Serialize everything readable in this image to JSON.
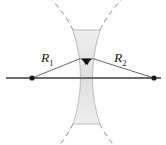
{
  "figure": {
    "name": "biconcave-lens-radii-of-curvature",
    "background_color": "#ffffff"
  },
  "labels": [
    {
      "id": "r1",
      "name": "radius-label-r1",
      "symbol": "R",
      "subscript": "1",
      "x": 41,
      "y": 62,
      "color": "#1a1a1a"
    },
    {
      "id": "r2",
      "name": "radius-label-r2",
      "symbol": "R",
      "subscript": "2",
      "x": 114,
      "y": 62,
      "color": "#1a1a1a"
    }
  ],
  "optical_axis": {
    "name": "optical-axis",
    "x1": 6,
    "y1": 78,
    "x2": 161,
    "y2": 78,
    "color": "#6b6b6b",
    "width": 2.2
  },
  "centers_of_curvature": [
    {
      "name": "center-of-curvature-left",
      "cx": 32,
      "cy": 78,
      "r": 2.6,
      "color": "#1a1a1a"
    },
    {
      "name": "center-of-curvature-right",
      "cx": 154,
      "cy": 78,
      "r": 2.6,
      "color": "#1a1a1a"
    }
  ],
  "radius_lines": [
    {
      "name": "radius-line-r1",
      "from_x": 32,
      "from_y": 78,
      "to_x": 80.5,
      "to_y": 58.5,
      "color": "#555555",
      "width": 0.9
    },
    {
      "name": "radius-line-r2",
      "from_x": 154,
      "from_y": 78,
      "to_x": 92.5,
      "to_y": 58.5,
      "color": "#555555",
      "width": 0.9
    }
  ],
  "arrowheads": [
    {
      "name": "arrowhead-r1",
      "tip_x": 80.5,
      "tip_y": 58.5,
      "angle_deg": 202,
      "color": "#111111"
    },
    {
      "name": "arrowhead-r2",
      "tip_x": 92.5,
      "tip_y": 58.5,
      "angle_deg": 338,
      "color": "#111111"
    }
  ],
  "lens": {
    "name": "biconcave-lens-body",
    "fill_top": "#ededed",
    "fill_mid": "#e2e2e2",
    "fill_bottom": "#ededed",
    "stroke": "#b5b5b5",
    "stroke_width": 0.9,
    "top_y": 30,
    "bottom_y": 124,
    "center_y": 78,
    "left_surface": {
      "name": "left-lens-surface",
      "top_x": 73,
      "waist_x": 80.5,
      "bottom_x": 73
    },
    "right_surface": {
      "name": "right-lens-surface",
      "top_x": 100,
      "waist_x": 92.5,
      "bottom_x": 100
    },
    "path": "M 73,30 Q 80.5,54 80.5,78 Q 80.5,102 73,124 L 100,124 Q 92.5,102 92.5,78 Q 92.5,54 100,30 Z"
  },
  "dashed_arcs": [
    {
      "name": "dashed-arc-left-upper",
      "path": "M 73,30 Q 65,14 52,0",
      "color": "#8a8a8a",
      "dash": "5,4",
      "width": 1.0
    },
    {
      "name": "dashed-arc-left-lower",
      "path": "M 73,124 Q 65,140 52,154",
      "color": "#8a8a8a",
      "dash": "5,4",
      "width": 1.0
    },
    {
      "name": "dashed-arc-right-upper",
      "path": "M 100,30 Q 108,14 121,0",
      "color": "#8a8a8a",
      "dash": "5,4",
      "width": 1.0
    },
    {
      "name": "dashed-arc-right-lower",
      "path": "M 100,124 Q 108,140 121,154",
      "color": "#8a8a8a",
      "dash": "5,4",
      "width": 1.0
    }
  ]
}
